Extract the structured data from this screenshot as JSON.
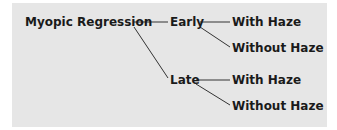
{
  "diagram": {
    "type": "tree",
    "background_color": "#e6e6e6",
    "line_color": "#333333",
    "root": {
      "label": "Myopic Regression",
      "children": [
        {
          "label": "Early",
          "children": [
            {
              "label": "With Haze"
            },
            {
              "label": "Without Haze"
            }
          ]
        },
        {
          "label": "Late",
          "children": [
            {
              "label": "With Haze"
            },
            {
              "label": "Without Haze"
            }
          ]
        }
      ]
    }
  }
}
